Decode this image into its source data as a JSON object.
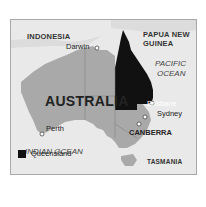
{
  "map": {
    "title": "AUSTRALIA",
    "highlighted_region": "Queensland",
    "colors": {
      "sea": "#e9e9e9",
      "land": "#a9a9a9",
      "highlight": "#111111",
      "border": "#a8a8a8"
    },
    "labels": {
      "indonesia": "INDONESIA",
      "png_line1": "PAPUA NEW",
      "png_line2": "GUINEA",
      "pacific_line1": "PACIFIC",
      "pacific_line2": "OCEAN",
      "indian": "INDIAN OCEAN",
      "tasmania": "TASMANIA"
    },
    "cities": {
      "darwin": "Darwin",
      "brisbane": "Brisbane",
      "perth": "Perth",
      "sydney": "Sydney",
      "canberra": "CANBERRA"
    },
    "legend": {
      "label": "Queensland",
      "swatch_color": "#111111"
    }
  }
}
